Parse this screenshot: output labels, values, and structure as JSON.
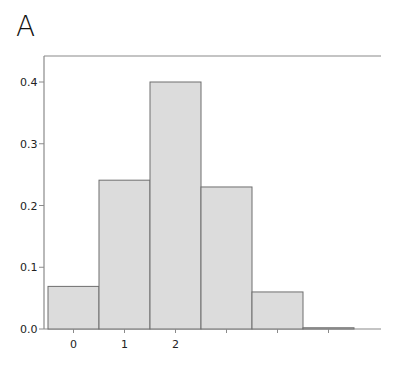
{
  "panel": {
    "label": "A"
  },
  "chart_data": {
    "type": "bar",
    "title": "",
    "panel_label": "A",
    "xlabel": "",
    "ylabel": "",
    "categories": [
      "0",
      "1",
      "2",
      "3",
      "4",
      "5"
    ],
    "x_tick_labels": [
      "0",
      "1",
      "2",
      "",
      "",
      ""
    ],
    "values": [
      0.069,
      0.241,
      0.4,
      0.23,
      0.06,
      0.002
    ],
    "ylim": [
      0.0,
      0.45
    ],
    "y_ticks": [
      0.0,
      0.1,
      0.2,
      0.3,
      0.4
    ],
    "y_tick_labels": [
      "0.0",
      "0.1",
      "0.2",
      "0.3",
      "0.4"
    ],
    "grid": false,
    "legend": null,
    "bar_fill": "#dcdcdc",
    "bar_stroke": "#6e6e6e",
    "axis_color": "#8a8a8a"
  }
}
